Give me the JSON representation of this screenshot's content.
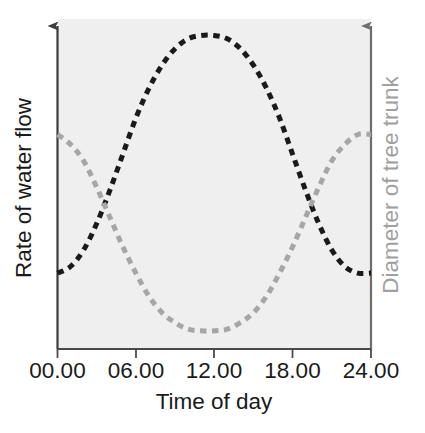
{
  "chart_data": {
    "type": "line",
    "title": "",
    "subtitle": "",
    "xlabel": "Time of day",
    "ylabel_left": "Rate of water flow",
    "ylabel_right": "Diameter of tree trunk",
    "xlim": [
      0,
      24
    ],
    "ylim": [
      0,
      1
    ],
    "grid": false,
    "legend": "none",
    "xticks": [
      0,
      6,
      12,
      18,
      24
    ],
    "xtick_labels": [
      "00.00",
      "06.00",
      "12.00",
      "18.00",
      "24.00"
    ],
    "yticks": [],
    "ytick_labels": [],
    "plot_background": "#efefef",
    "series": [
      {
        "name": "Rate of water flow",
        "axis": "left",
        "color": "#1a1a1a",
        "style": "dashed",
        "x": [
          0,
          1,
          2,
          3,
          4,
          5,
          6,
          7,
          8,
          9,
          10,
          11,
          12,
          13,
          14,
          15,
          16,
          17,
          18,
          19,
          20,
          21,
          22,
          23,
          24
        ],
        "values": [
          0.23,
          0.25,
          0.3,
          0.38,
          0.48,
          0.59,
          0.7,
          0.79,
          0.86,
          0.91,
          0.94,
          0.95,
          0.95,
          0.94,
          0.91,
          0.86,
          0.79,
          0.7,
          0.59,
          0.48,
          0.38,
          0.3,
          0.25,
          0.23,
          0.23
        ]
      },
      {
        "name": "Diameter of tree trunk",
        "axis": "right",
        "color": "#a6a6a6",
        "style": "dashed",
        "x": [
          0,
          1,
          2,
          3,
          4,
          5,
          6,
          7,
          8,
          9,
          10,
          11,
          12,
          13,
          14,
          15,
          16,
          17,
          18,
          19,
          20,
          21,
          22,
          23,
          24
        ],
        "values": [
          0.65,
          0.62,
          0.57,
          0.49,
          0.4,
          0.31,
          0.23,
          0.16,
          0.11,
          0.08,
          0.06,
          0.055,
          0.055,
          0.06,
          0.08,
          0.11,
          0.16,
          0.23,
          0.31,
          0.4,
          0.49,
          0.57,
          0.62,
          0.65,
          0.65
        ]
      }
    ]
  },
  "axes": {
    "left_axis_name": "left-value-axis",
    "right_axis_name": "right-value-axis",
    "bottom_axis_name": "time-axis",
    "left_arrow": "arrow-up-icon",
    "right_arrow": "arrow-up-icon"
  },
  "colors": {
    "water_flow": "#1a1a1a",
    "trunk_diameter": "#a6a6a6",
    "plot_background": "#efefef",
    "axis_left": "#3d3d3d",
    "axis_right": "#8c8c8c",
    "page_background": "#ffffff"
  }
}
